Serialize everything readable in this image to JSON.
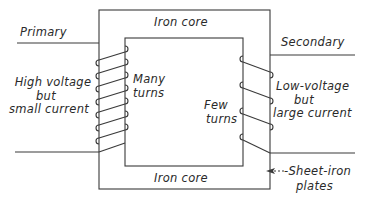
{
  "diagram": {
    "labels": {
      "iron_core_top": "Iron core",
      "iron_core_bottom": "Iron core",
      "primary": "Primary",
      "secondary": "Secondary",
      "primary_desc_line1": "High voltage",
      "primary_desc_line2": "but",
      "primary_desc_line3": "small current",
      "many_turns_line1": "Many",
      "many_turns_line2": "turns",
      "few_turns_line1": "Few",
      "few_turns_line2": "turns",
      "secondary_desc_line1": "Low-voltage",
      "secondary_desc_line2": "but",
      "secondary_desc_line3": "large current",
      "sheet_iron_line1": "Sheet-iron",
      "sheet_iron_line2": "plates"
    },
    "components": {
      "core": {
        "outer": [
          99,
          10,
          270,
          189
        ],
        "inner": [
          125,
          38,
          243,
          166
        ]
      },
      "primary_coil": {
        "turns": 7
      },
      "secondary_coil": {
        "turns": 4
      }
    },
    "colors": {
      "line": "#3a3a3a",
      "text": "#2a2a2a",
      "background": "#ffffff"
    }
  }
}
